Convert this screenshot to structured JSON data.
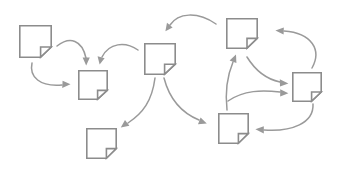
{
  "diagram": {
    "title": "Document Flow Diagram",
    "type": "node-link flow",
    "background_color": "#ffffff",
    "node_stroke_color": "#8c8c8c",
    "node_fill_color": "#ffffff",
    "arrow_color": "#9a9a9a",
    "node_count": 7,
    "arrow_count": 9,
    "node_icon_name": "document-page-folded-corner-icon",
    "nodes": [
      {
        "id": "doc-1",
        "label": "",
        "icon": "document-page-folded-corner-icon",
        "x": 19,
        "y": 25,
        "w": 33,
        "h": 33,
        "fold": 10,
        "position_hint": "top-left"
      },
      {
        "id": "doc-2",
        "label": "",
        "icon": "document-page-folded-corner-icon",
        "x": 78,
        "y": 70,
        "w": 30,
        "h": 30,
        "fold": 9,
        "position_hint": "upper-left-mid"
      },
      {
        "id": "doc-3",
        "label": "",
        "icon": "document-page-folded-corner-icon",
        "x": 144,
        "y": 43,
        "w": 32,
        "h": 32,
        "fold": 10,
        "position_hint": "center"
      },
      {
        "id": "doc-4",
        "label": "",
        "icon": "document-page-folded-corner-icon",
        "x": 226,
        "y": 18,
        "w": 32,
        "h": 31,
        "fold": 10,
        "position_hint": "top-right"
      },
      {
        "id": "doc-5",
        "label": "",
        "icon": "document-page-folded-corner-icon",
        "x": 292,
        "y": 72,
        "w": 30,
        "h": 30,
        "fold": 9,
        "position_hint": "right"
      },
      {
        "id": "doc-6",
        "label": "",
        "icon": "document-page-folded-corner-icon",
        "x": 218,
        "y": 113,
        "w": 31,
        "h": 31,
        "fold": 10,
        "position_hint": "bottom-right"
      },
      {
        "id": "doc-7",
        "label": "",
        "icon": "document-page-folded-corner-icon",
        "x": 86,
        "y": 128,
        "w": 31,
        "h": 31,
        "fold": 10,
        "position_hint": "bottom-left"
      }
    ],
    "arrows": [
      {
        "id": "arrow-1",
        "label": "",
        "from": "doc-1",
        "to": "doc-2",
        "path": "M 57 46 C 70 37 82 40 86 59",
        "head_at": [
          86,
          64
        ],
        "head_angle": 92,
        "curve": "clockwise"
      },
      {
        "id": "arrow-2",
        "label": "",
        "from": "doc-1",
        "to": "doc-2",
        "path": "M 32 63 C 30 77 40 86 63 85",
        "head_at": [
          70,
          85
        ],
        "head_angle": 5,
        "curve": "clockwise"
      },
      {
        "id": "arrow-3",
        "label": "",
        "from": "doc-3",
        "to": "doc-2",
        "path": "M 137 49 C 124 41 108 43 102 58",
        "head_at": [
          100,
          64
        ],
        "head_angle": 105,
        "curve": "counter-clockwise"
      },
      {
        "id": "arrow-4",
        "label": "",
        "from": "doc-4",
        "to": "doc-3",
        "path": "M 217 25 C 198 12 178 13 170 24",
        "head_at": [
          166,
          30
        ],
        "head_angle": 128,
        "curve": "counter-clockwise"
      },
      {
        "id": "arrow-5",
        "label": "",
        "from": "doc-3",
        "to": "doc-7",
        "path": "M 155 78 C 152 100 142 113 127 124",
        "head_at": [
          121,
          128
        ],
        "head_angle": 145,
        "curve": "counter-clockwise"
      },
      {
        "id": "arrow-6",
        "label": "",
        "from": "doc-3",
        "to": "doc-6",
        "path": "M 164 78 C 170 100 182 113 199 121",
        "head_at": [
          206,
          124
        ],
        "head_angle": 25,
        "curve": "clockwise"
      },
      {
        "id": "arrow-7",
        "label": "",
        "from": "doc-6",
        "to": "doc-4",
        "path": "M 227 109 C 226 92 228 75 233 60",
        "head_at": [
          235,
          54
        ],
        "head_angle": -80,
        "curve": "slight"
      },
      {
        "id": "arrow-8",
        "label": "",
        "from": "doc-4",
        "to": "doc-5",
        "path": "M 247 56 C 254 70 266 80 281 83",
        "head_at": [
          288,
          84
        ],
        "head_angle": 12,
        "curve": "clockwise"
      },
      {
        "id": "arrow-9",
        "label": "",
        "from": "doc-6",
        "to": "doc-5",
        "path": "M 230 100 C 245 90 262 90 280 92",
        "head_at": [
          288,
          93
        ],
        "head_angle": 8,
        "curve": "counter-clockwise"
      },
      {
        "id": "arrow-10",
        "label": "",
        "from": "doc-5",
        "to": "doc-4",
        "path": "M 311 69 C 320 52 312 34 283 31",
        "head_at": [
          275,
          31
        ],
        "head_angle": 182,
        "curve": "counter-clockwise"
      },
      {
        "id": "arrow-11",
        "label": "",
        "from": "doc-5",
        "to": "doc-6",
        "path": "M 312 104 C 312 122 292 131 264 130",
        "head_at": [
          256,
          130
        ],
        "head_angle": 182,
        "curve": "clockwise"
      }
    ]
  }
}
